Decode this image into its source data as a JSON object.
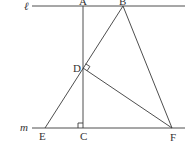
{
  "diagram": {
    "type": "geometry",
    "lines": {
      "l": {
        "label": "ℓ",
        "y": 6,
        "x1": 32,
        "x2": 185
      },
      "m": {
        "label": "m",
        "y": 128,
        "x1": 32,
        "x2": 185
      }
    },
    "points": {
      "A": {
        "label": "A",
        "x": 83,
        "y": 6
      },
      "B": {
        "label": "B",
        "x": 123,
        "y": 6
      },
      "C": {
        "label": "C",
        "x": 83,
        "y": 128
      },
      "D": {
        "label": "D",
        "x": 83,
        "y": 68
      },
      "E": {
        "label": "E",
        "x": 45,
        "y": 128
      },
      "F": {
        "label": "F",
        "x": 172,
        "y": 128
      }
    },
    "segments": [
      [
        "A",
        "C"
      ],
      [
        "B",
        "E"
      ],
      [
        "B",
        "F"
      ],
      [
        "D",
        "F"
      ]
    ],
    "right_angles": [
      "C",
      "D"
    ],
    "colors": {
      "stroke": "#3a3a3a",
      "text": "#333333",
      "background": "#ffffff"
    }
  }
}
